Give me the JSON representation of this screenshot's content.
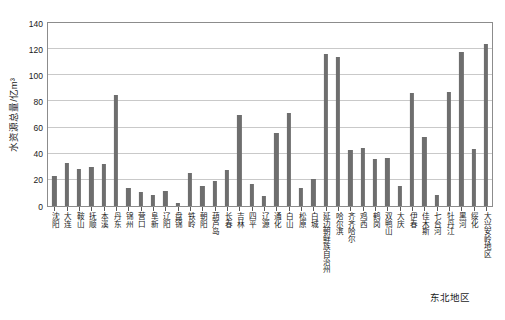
{
  "chart_data": {
    "type": "bar",
    "title": "",
    "xlabel": "东北地区",
    "ylabel": "水资源总量/亿m³",
    "ylim": [
      0,
      140
    ],
    "yticks": [
      0,
      20,
      40,
      60,
      80,
      100,
      120,
      140
    ],
    "grid": true,
    "legend": "none",
    "bar_color": "#6e6e6e",
    "categories": [
      "沈阳",
      "大连",
      "鞍山",
      "抚顺",
      "本溪",
      "丹东",
      "锦州",
      "营口",
      "阜新",
      "辽阳",
      "盘锦",
      "铁岭",
      "朝阳",
      "葫芦岛",
      "长春",
      "吉林",
      "四平",
      "辽源",
      "通化",
      "白山",
      "松原",
      "白城",
      "延边朝鲜族自治州",
      "哈尔滨",
      "齐齐哈尔",
      "鸡西",
      "鹤岗",
      "双鸭山",
      "大庆",
      "伊春",
      "佳木斯",
      "七台河",
      "牡丹江",
      "黑河",
      "绥化",
      "大兴安岭地区"
    ],
    "values": [
      23,
      33,
      28.5,
      30,
      32,
      85,
      14,
      11,
      8.5,
      11.5,
      2.5,
      25,
      15,
      19.5,
      27.5,
      70,
      16.5,
      7.5,
      55.5,
      71,
      14,
      20.5,
      116,
      114,
      42.5,
      44.5,
      36,
      37,
      15,
      86.5,
      52.5,
      8.5,
      87,
      117.5,
      43.5,
      124
    ]
  }
}
